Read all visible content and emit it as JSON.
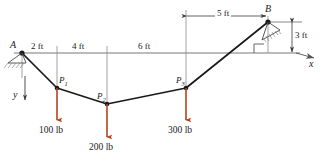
{
  "figure": {
    "type": "statics-cable-diagram",
    "colors": {
      "cable": "#1a1a1a",
      "load_arrow": "#b5441f",
      "axis": "#555555",
      "dimension": "#3a3a3a",
      "hatch": "#777777"
    },
    "supports": [
      {
        "name": "A",
        "label": "A",
        "kind": "pin-support",
        "x": 22,
        "y": 53
      },
      {
        "name": "B",
        "label": "B",
        "kind": "pin-support",
        "x": 268,
        "y": 22
      }
    ],
    "nodes": [
      {
        "name": "P1",
        "label": "P",
        "sub": "1",
        "x": 57,
        "y": 88
      },
      {
        "name": "P2",
        "label": "P",
        "sub": "2",
        "x": 107,
        "y": 104
      },
      {
        "name": "P3",
        "label": "P",
        "sub": "3",
        "x": 186,
        "y": 88
      }
    ],
    "loads": [
      {
        "name": "load-100lb",
        "value": "100 lb",
        "at_node": "P1",
        "direction": "down",
        "x": 57,
        "y": 88
      },
      {
        "name": "load-200lb",
        "value": "200 lb",
        "at_node": "P2",
        "direction": "down",
        "x": 107,
        "y": 104
      },
      {
        "name": "load-300lb",
        "value": "300 lb",
        "at_node": "P3",
        "direction": "down",
        "x": 186,
        "y": 88
      }
    ],
    "dimensions_horizontal_top": [
      {
        "name": "dim-2ft",
        "label": "2 ft",
        "from_x": 22,
        "to_x": 57,
        "y": 53
      },
      {
        "name": "dim-4ft",
        "label": "4 ft",
        "from_x": 57,
        "to_x": 107,
        "y": 53
      },
      {
        "name": "dim-6ft",
        "label": "6 ft",
        "from_x": 107,
        "to_x": 186,
        "y": 53
      }
    ],
    "dimension_5ft": {
      "name": "dim-5ft",
      "label": "5 ft",
      "from_x": 186,
      "to_x": 268,
      "y": 16
    },
    "dimension_3ft": {
      "name": "dim-3ft",
      "label": "3 ft",
      "x": 292,
      "from_y": 22,
      "to_y": 53
    },
    "axes": [
      {
        "name": "x-axis",
        "label": "x",
        "direction": "right",
        "x": 310,
        "y": 60
      },
      {
        "name": "y-axis",
        "label": "y",
        "direction": "down",
        "x": 20,
        "y": 98
      }
    ],
    "right_angle_marker": {
      "name": "right-angle-marker",
      "x": 254,
      "y": 45
    }
  }
}
